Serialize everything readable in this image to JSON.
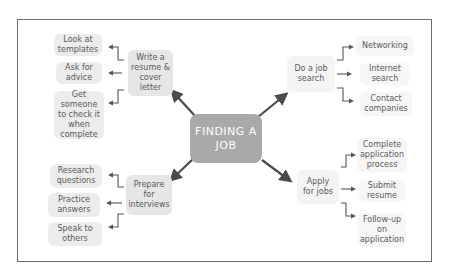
{
  "diagram": {
    "type": "mind-map",
    "center": {
      "label": "FINDING A JOB"
    },
    "branches": [
      {
        "label": "Write a resume & cover letter",
        "position": "top-left",
        "children": [
          "Look at templates",
          "Ask for advice",
          "Get someone to check it when complete"
        ]
      },
      {
        "label": "Do a job search",
        "position": "top-right",
        "children": [
          "Networking",
          "Internet search",
          "Contact companies"
        ]
      },
      {
        "label": "Prepare for interviews",
        "position": "bottom-left",
        "children": [
          "Research questions",
          "Practice answers",
          "Speak to others"
        ]
      },
      {
        "label": "Apply for jobs",
        "position": "bottom-right",
        "children": [
          "Complete application process",
          "Submit resume",
          "Follow-up on application"
        ]
      }
    ]
  },
  "colors": {
    "center_fill": "#a9a9a9",
    "node_fill": "#ececec",
    "arrow": "#4a4a4a",
    "frame": "#6a6a6a"
  }
}
